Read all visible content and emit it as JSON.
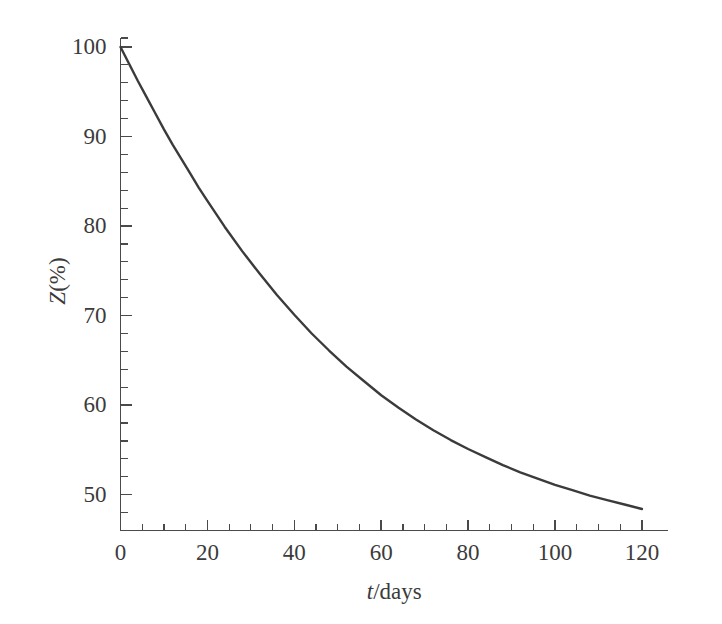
{
  "figure": {
    "background_color": "#ffffff",
    "curve_color": "#3b3b3b",
    "axis_color": "#4a4a4a"
  },
  "chart_data": {
    "type": "line",
    "title": "",
    "xlabel": "t/days",
    "xlabel_italic_part": "t",
    "xlabel_rest": "/days",
    "ylabel": "Z(%)",
    "ylabel_italic_part": "Z",
    "ylabel_rest": "(%)",
    "xlim": [
      0,
      126
    ],
    "ylim": [
      46,
      101
    ],
    "grid": false,
    "legend": null,
    "x_major_ticks": [
      0,
      20,
      40,
      60,
      80,
      100,
      120
    ],
    "x_major_tick_labels": [
      "0",
      "20",
      "40",
      "60",
      "80",
      "100",
      "120"
    ],
    "x_minor_tick_interval": 5,
    "y_major_ticks": [
      50,
      60,
      70,
      80,
      90,
      100
    ],
    "y_major_tick_labels": [
      "50",
      "60",
      "70",
      "80",
      "90",
      "100"
    ],
    "y_minor_tick_interval": 2,
    "series": [
      {
        "name": "Z",
        "x": [
          0,
          2,
          4,
          6,
          8,
          10,
          12,
          14,
          16,
          18,
          20,
          24,
          28,
          32,
          36,
          40,
          44,
          48,
          52,
          56,
          60,
          64,
          68,
          72,
          76,
          80,
          84,
          88,
          92,
          96,
          100,
          104,
          108,
          112,
          116,
          120
        ],
        "values": [
          100.0,
          98.1,
          96.2,
          94.4,
          92.6,
          90.8,
          89.1,
          87.5,
          85.9,
          84.3,
          82.8,
          79.9,
          77.2,
          74.7,
          72.3,
          70.1,
          68.0,
          66.1,
          64.3,
          62.7,
          61.1,
          59.7,
          58.4,
          57.2,
          56.1,
          55.1,
          54.2,
          53.3,
          52.5,
          51.8,
          51.1,
          50.5,
          49.9,
          49.4,
          48.9,
          48.4
        ]
      }
    ],
    "annotations": []
  }
}
